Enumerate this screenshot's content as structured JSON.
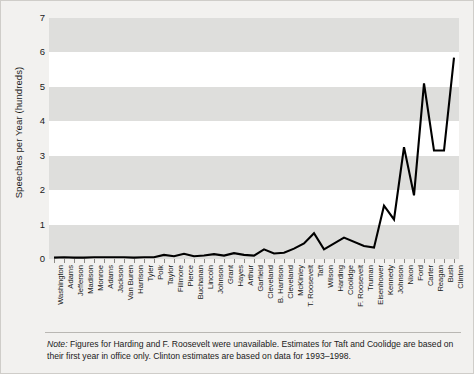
{
  "chart_data": {
    "type": "line",
    "title": "",
    "xlabel": "",
    "ylabel": "Speeches per Year (hundreds)",
    "ylim": [
      0,
      7
    ],
    "yticks": [
      0,
      1,
      2,
      3,
      4,
      5,
      6,
      7
    ],
    "grid": "alternating horizontal bands",
    "legend": "none",
    "line_color": "#000000",
    "categories": [
      "Washington",
      "Adams",
      "Jefferson",
      "Madison",
      "Monroe",
      "Adams",
      "Jackson",
      "Van Buren",
      "Harrison",
      "Tyler",
      "Polk",
      "Taylor",
      "Fillmore",
      "Pierce",
      "Buchanan",
      "Lincoln",
      "Johnson",
      "Grant",
      "Hayes",
      "Arthur",
      "Garfield",
      "Cleveland",
      "B. Harrison",
      "Cleveland",
      "McKinley",
      "T. Roosevelt",
      "Taft",
      "Wilson",
      "Harding",
      "Coolidge",
      "F. Roosevelt",
      "Truman",
      "Eisenhower",
      "Kennedy",
      "Johnson",
      "Nixon",
      "Ford",
      "Carter",
      "Reagan",
      "Bush",
      "Clinton"
    ],
    "values": [
      0.04,
      0.05,
      0.04,
      0.04,
      0.05,
      0.05,
      0.05,
      0.05,
      0.04,
      0.05,
      0.05,
      0.12,
      0.08,
      0.15,
      0.08,
      0.1,
      0.14,
      0.1,
      0.17,
      0.12,
      0.1,
      0.28,
      0.16,
      0.18,
      0.3,
      0.45,
      0.75,
      0.28,
      null,
      0.62,
      null,
      0.38,
      0.33,
      1.55,
      1.15,
      3.25,
      1.85,
      5.1,
      3.15,
      3.15,
      5.85
    ],
    "annotations": {
      "note_lead": "Note:",
      "note_text": " Figures for Harding and F. Roosevelt were unavailable. Estimates for Taft and Coolidge are based on their first year in office only. Clinton estimates are based on data for 1993–1998."
    }
  }
}
